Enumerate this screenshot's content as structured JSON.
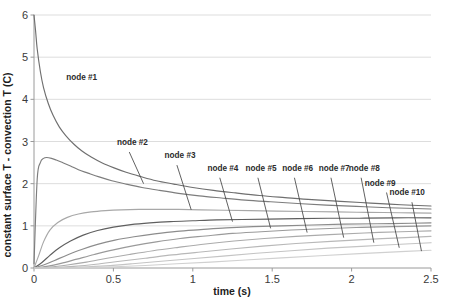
{
  "chart_data": {
    "type": "line",
    "title": "",
    "xlabel": "time (s)",
    "ylabel": "constant surface T - convection T (C)",
    "xlim": [
      0,
      2.5
    ],
    "ylim": [
      0,
      6
    ],
    "xticks": [
      "0",
      "0.5",
      "1",
      "1.5",
      "2",
      "2.5"
    ],
    "xtick_values": [
      0,
      0.5,
      1,
      1.5,
      2,
      2.5
    ],
    "yticks": [
      "0",
      "1",
      "2",
      "3",
      "4",
      "5",
      "6"
    ],
    "ytick_values": [
      0,
      1,
      2,
      3,
      4,
      5,
      6
    ],
    "grid": true,
    "grid_axis": "y",
    "legend": "inline-annotations",
    "series": [
      {
        "name": "node #1",
        "color": "#6f6f6f",
        "x": [
          0.0,
          0.01,
          0.02,
          0.04,
          0.06,
          0.09,
          0.12,
          0.16,
          0.2,
          0.25,
          0.3,
          0.36,
          0.43,
          0.5,
          0.58,
          0.67,
          0.77,
          0.88,
          1.0,
          1.13,
          1.27,
          1.42,
          1.58,
          1.75,
          1.93,
          2.12,
          2.31,
          2.5
        ],
        "y": [
          6.0,
          5.62,
          5.2,
          4.66,
          4.28,
          3.9,
          3.62,
          3.34,
          3.14,
          2.94,
          2.78,
          2.63,
          2.49,
          2.38,
          2.27,
          2.17,
          2.07,
          1.99,
          1.91,
          1.84,
          1.78,
          1.72,
          1.67,
          1.62,
          1.58,
          1.54,
          1.5,
          1.47
        ]
      },
      {
        "name": "node #2",
        "color": "#7d7d7d",
        "x": [
          0.0,
          0.02,
          0.04,
          0.06,
          0.08,
          0.11,
          0.14,
          0.18,
          0.23,
          0.28,
          0.34,
          0.41,
          0.49,
          0.58,
          0.68,
          0.79,
          0.91,
          1.04,
          1.18,
          1.33,
          1.49,
          1.66,
          1.84,
          2.03,
          2.23,
          2.5
        ],
        "y": [
          0.1,
          2.1,
          2.5,
          2.6,
          2.62,
          2.6,
          2.56,
          2.5,
          2.42,
          2.33,
          2.25,
          2.16,
          2.07,
          1.99,
          1.91,
          1.84,
          1.77,
          1.71,
          1.66,
          1.61,
          1.57,
          1.53,
          1.49,
          1.46,
          1.43,
          1.4
        ]
      },
      {
        "name": "node #3",
        "color": "#a8a8a8",
        "x": [
          0.0,
          0.03,
          0.06,
          0.1,
          0.15,
          0.21,
          0.28,
          0.36,
          0.45,
          0.55,
          0.66,
          0.78,
          0.91,
          1.05,
          1.2,
          1.36,
          1.53,
          1.71,
          1.9,
          2.1,
          2.3,
          2.5
        ],
        "y": [
          0.0,
          0.3,
          0.62,
          0.9,
          1.08,
          1.2,
          1.28,
          1.33,
          1.36,
          1.38,
          1.39,
          1.39,
          1.39,
          1.38,
          1.37,
          1.36,
          1.35,
          1.34,
          1.33,
          1.32,
          1.31,
          1.3
        ]
      },
      {
        "name": "node #4",
        "color": "#5f5f5f",
        "x": [
          0.0,
          0.05,
          0.1,
          0.16,
          0.23,
          0.31,
          0.4,
          0.5,
          0.61,
          0.73,
          0.86,
          1.0,
          1.15,
          1.31,
          1.48,
          1.66,
          1.85,
          2.05,
          2.26,
          2.5
        ],
        "y": [
          0.0,
          0.13,
          0.3,
          0.48,
          0.64,
          0.78,
          0.89,
          0.97,
          1.03,
          1.07,
          1.1,
          1.12,
          1.14,
          1.15,
          1.16,
          1.17,
          1.18,
          1.18,
          1.19,
          1.19
        ]
      },
      {
        "name": "node #5",
        "color": "#8c8c8c",
        "x": [
          0.0,
          0.06,
          0.13,
          0.21,
          0.3,
          0.4,
          0.51,
          0.63,
          0.76,
          0.9,
          1.05,
          1.21,
          1.38,
          1.56,
          1.75,
          1.95,
          2.16,
          2.38,
          2.5
        ],
        "y": [
          0.0,
          0.07,
          0.18,
          0.31,
          0.44,
          0.56,
          0.66,
          0.74,
          0.81,
          0.87,
          0.91,
          0.95,
          0.98,
          1.0,
          1.02,
          1.04,
          1.05,
          1.06,
          1.07
        ]
      },
      {
        "name": "node #6",
        "color": "#9a9a9a",
        "x": [
          0.0,
          0.08,
          0.17,
          0.27,
          0.38,
          0.5,
          0.63,
          0.77,
          0.92,
          1.08,
          1.25,
          1.43,
          1.62,
          1.82,
          2.03,
          2.25,
          2.5
        ],
        "y": [
          0.0,
          0.04,
          0.11,
          0.21,
          0.32,
          0.43,
          0.53,
          0.62,
          0.7,
          0.76,
          0.82,
          0.86,
          0.9,
          0.93,
          0.96,
          0.98,
          1.0
        ]
      },
      {
        "name": "node #7",
        "color": "#ababab",
        "x": [
          0.0,
          0.1,
          0.21,
          0.33,
          0.46,
          0.6,
          0.75,
          0.91,
          1.08,
          1.26,
          1.45,
          1.65,
          1.86,
          2.08,
          2.31,
          2.5
        ],
        "y": [
          0.0,
          0.02,
          0.07,
          0.14,
          0.23,
          0.32,
          0.41,
          0.49,
          0.57,
          0.64,
          0.7,
          0.75,
          0.79,
          0.83,
          0.86,
          0.88
        ]
      },
      {
        "name": "node #8",
        "color": "#b8b8b8",
        "x": [
          0.0,
          0.12,
          0.25,
          0.39,
          0.54,
          0.7,
          0.87,
          1.05,
          1.24,
          1.44,
          1.65,
          1.87,
          2.1,
          2.34,
          2.5
        ],
        "y": [
          0.0,
          0.01,
          0.04,
          0.09,
          0.16,
          0.23,
          0.31,
          0.38,
          0.45,
          0.52,
          0.58,
          0.63,
          0.68,
          0.72,
          0.75
        ]
      },
      {
        "name": "node #9",
        "color": "#c4c4c4",
        "x": [
          0.0,
          0.14,
          0.29,
          0.45,
          0.62,
          0.8,
          0.99,
          1.19,
          1.4,
          1.62,
          1.85,
          2.09,
          2.34,
          2.5
        ],
        "y": [
          0.0,
          0.0,
          0.02,
          0.05,
          0.1,
          0.16,
          0.22,
          0.28,
          0.35,
          0.41,
          0.47,
          0.52,
          0.57,
          0.6
        ]
      },
      {
        "name": "node #10",
        "color": "#d0d0d0",
        "x": [
          0.0,
          0.16,
          0.33,
          0.51,
          0.7,
          0.9,
          1.11,
          1.33,
          1.56,
          1.8,
          2.05,
          2.31,
          2.5
        ],
        "y": [
          0.0,
          0.0,
          0.01,
          0.03,
          0.06,
          0.1,
          0.14,
          0.19,
          0.24,
          0.29,
          0.34,
          0.39,
          0.42
        ]
      }
    ],
    "annotations": [
      {
        "label": "node #1",
        "label_x": 0.3,
        "label_y": 4.45,
        "leader": false
      },
      {
        "label": "node #2",
        "label_x": 0.62,
        "label_y": 2.92,
        "leader": true,
        "lx": 0.6,
        "ly": 2.75,
        "cx": 0.69,
        "cy": 2.0
      },
      {
        "label": "node #3",
        "label_x": 0.92,
        "label_y": 2.6,
        "leader": true,
        "lx": 0.9,
        "ly": 2.44,
        "cx": 0.99,
        "cy": 1.38
      },
      {
        "label": "node #4",
        "label_x": 1.19,
        "label_y": 2.3,
        "leader": true,
        "lx": 1.17,
        "ly": 2.14,
        "cx": 1.25,
        "cy": 1.1
      },
      {
        "label": "node #5",
        "label_x": 1.43,
        "label_y": 2.3,
        "leader": true,
        "lx": 1.41,
        "ly": 2.14,
        "cx": 1.49,
        "cy": 0.94
      },
      {
        "label": "node #6",
        "label_x": 1.66,
        "label_y": 2.3,
        "leader": true,
        "lx": 1.64,
        "ly": 2.14,
        "cx": 1.72,
        "cy": 0.84
      },
      {
        "label": "node #7",
        "label_x": 1.89,
        "label_y": 2.3,
        "leader": true,
        "lx": 1.87,
        "ly": 2.14,
        "cx": 1.95,
        "cy": 0.72
      },
      {
        "label": "node #8",
        "label_x": 2.08,
        "label_y": 2.3,
        "leader": true,
        "lx": 2.06,
        "ly": 2.14,
        "cx": 2.14,
        "cy": 0.6
      },
      {
        "label": "node #9",
        "label_x": 2.18,
        "label_y": 1.95,
        "leader": true,
        "lx": 2.22,
        "ly": 1.79,
        "cx": 2.3,
        "cy": 0.48
      },
      {
        "label": "node #10",
        "label_x": 2.35,
        "label_y": 1.72,
        "leader": true,
        "lx": 2.38,
        "ly": 1.56,
        "cx": 2.44,
        "cy": 0.4
      }
    ]
  },
  "colors": {
    "grid": "#d9d9d9",
    "axis": "#9a9a9a",
    "text": "#2b2b2b",
    "background": "#ffffff"
  }
}
